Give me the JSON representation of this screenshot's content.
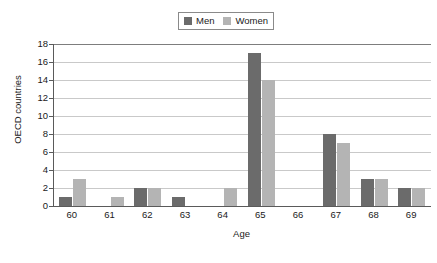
{
  "chart_data": {
    "type": "bar",
    "title": "",
    "xlabel": "Age",
    "ylabel": "OECD countries",
    "categories": [
      "60",
      "61",
      "62",
      "63",
      "64",
      "65",
      "66",
      "67",
      "68",
      "69"
    ],
    "series": [
      {
        "name": "Men",
        "color": "#6b6b6b",
        "values": [
          1,
          0,
          2,
          1,
          0,
          17,
          0,
          8,
          3,
          2
        ]
      },
      {
        "name": "Women",
        "color": "#b4b4b4",
        "values": [
          3,
          1,
          2,
          0,
          2,
          14,
          0,
          7,
          3,
          2
        ]
      }
    ],
    "ylim": [
      0,
      18
    ],
    "ytick_values": [
      0,
      2,
      4,
      6,
      8,
      10,
      12,
      14,
      16,
      18
    ],
    "ytick_labels": [
      "0",
      "2",
      "4",
      "6",
      "8",
      "10",
      "12",
      "14",
      "16",
      "18"
    ],
    "grid": true,
    "legend_position": "top-center"
  },
  "legend": {
    "entries": [
      {
        "label": "Men"
      },
      {
        "label": "Women"
      }
    ]
  },
  "colors": {
    "men": "#6b6b6b",
    "women": "#b4b4b4",
    "gridline": "#c9c9c9",
    "axis": "#5a5a5a",
    "text": "#1a1a1a",
    "background": "#ffffff"
  }
}
